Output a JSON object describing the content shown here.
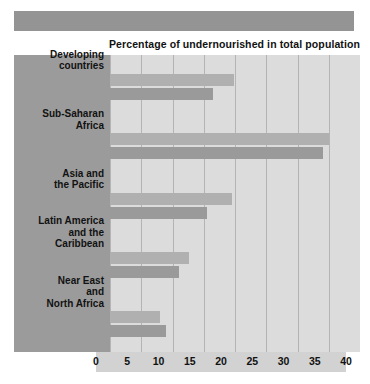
{
  "banner": {
    "name": "header-band"
  },
  "chart_data": {
    "type": "bar",
    "orientation": "horizontal",
    "title": "Percentage of undernourished in total population",
    "xlabel": "",
    "ylabel": "",
    "xlim": [
      0,
      40
    ],
    "xticks": [
      0,
      5,
      10,
      15,
      20,
      25,
      30,
      35,
      40
    ],
    "grid": true,
    "legend": "none",
    "categories": [
      "Developing countries",
      "Sub-Saharan Africa",
      "Asia and the Pacific",
      "Latin America and the Caribbean",
      "Near East and North Africa"
    ],
    "category_lines": [
      [
        "Developing",
        "countries"
      ],
      [
        "Sub-Saharan",
        "Africa"
      ],
      [
        "Asia and",
        "the Pacific"
      ],
      [
        "Latin America",
        "and the",
        "Caribbean"
      ],
      [
        "Near East",
        "and",
        "North Africa"
      ]
    ],
    "series": [
      {
        "name": "series-1",
        "color": "#b0b0b0",
        "values": [
          19.8,
          35.0,
          19.5,
          12.7,
          8.0
        ]
      },
      {
        "name": "series-2",
        "color": "#9a9a9a",
        "values": [
          16.5,
          34.0,
          15.5,
          11.0,
          9.0
        ]
      }
    ]
  },
  "colors": {
    "banner": "#949494",
    "label_panel": "#9b9b9b",
    "plot_background": "#dcdcdc",
    "gridline": "#b4b4b4",
    "axis_strip": "#d2d2d2",
    "text": "#111111"
  }
}
